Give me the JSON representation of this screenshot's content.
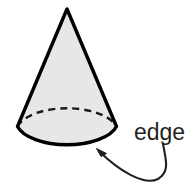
{
  "figure": {
    "background_color": "#ffffff",
    "shape": {
      "name": "cone",
      "fill_color": "#e7e7e7",
      "stroke_color": "#000000",
      "stroke_width": 3,
      "apex": {
        "x": 67,
        "y": 9
      },
      "base_center": {
        "x": 67,
        "y": 128
      },
      "base_radius_x": 51,
      "base_radius_y": 24,
      "hidden_edge_style": "dashed",
      "hidden_edge_dash_pattern": "7 5"
    },
    "annotation": {
      "label": "edge",
      "label_color": "#231f20",
      "label_x": 134,
      "label_y": 140,
      "leader_line_color": "#231f20",
      "leader_line_width": 2,
      "arrow_tip": {
        "x": 97,
        "y": 150
      },
      "leader_start": {
        "x": 163,
        "y": 144
      }
    }
  }
}
